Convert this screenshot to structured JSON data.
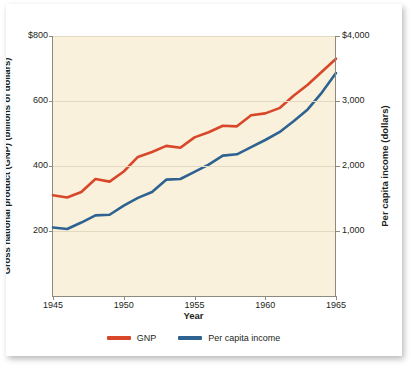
{
  "chart_data": {
    "type": "line",
    "title": "",
    "xlabel": "Year",
    "x": [
      1945,
      1946,
      1947,
      1948,
      1949,
      1950,
      1951,
      1952,
      1953,
      1954,
      1955,
      1956,
      1957,
      1958,
      1959,
      1960,
      1961,
      1962,
      1963,
      1964,
      1965
    ],
    "xlim": [
      1945,
      1965
    ],
    "xticks": [
      "1945",
      "1950",
      "1955",
      "1960",
      "1965"
    ],
    "xtick_values": [
      1945,
      1950,
      1955,
      1960,
      1965
    ],
    "grid": true,
    "legend_position": "bottom",
    "axes": [
      {
        "id": "left",
        "label": "Gross national product (GNP) (billions of dollars)",
        "ticks": [
          "$800",
          "600",
          "400",
          "200"
        ],
        "tick_values": [
          800,
          600,
          400,
          200
        ],
        "lim": [
          0,
          800
        ]
      },
      {
        "id": "right",
        "label": "Per capita income (dollars)",
        "ticks": [
          "$4,000",
          "3,000",
          "2,000",
          "1,000"
        ],
        "tick_values": [
          4000,
          3000,
          2000,
          1000
        ],
        "lim": [
          0,
          4000
        ]
      }
    ],
    "series": [
      {
        "name": "GNP",
        "axis": "left",
        "color": "#D9472B",
        "values": [
          310,
          303,
          320,
          360,
          352,
          383,
          428,
          443,
          462,
          456,
          488,
          504,
          524,
          522,
          556,
          562,
          578,
          616,
          650,
          690,
          730
        ]
      },
      {
        "name": "Per capita income",
        "axis": "right",
        "color": "#2E6391",
        "values": [
          1055,
          1030,
          1130,
          1240,
          1250,
          1390,
          1510,
          1600,
          1790,
          1800,
          1910,
          2020,
          2160,
          2180,
          2290,
          2400,
          2520,
          2690,
          2870,
          3130,
          3430
        ]
      }
    ]
  },
  "legend": {
    "entries": [
      {
        "label": "GNP",
        "color": "#D9472B"
      },
      {
        "label": "Per capita income",
        "color": "#2E6391"
      }
    ]
  },
  "colors": {
    "plot_background": "#FAF1DC",
    "page_background": "#FFFFFF",
    "gridline": "#E2D9C0",
    "axis": "#8D8A80",
    "text": "#231F20"
  }
}
